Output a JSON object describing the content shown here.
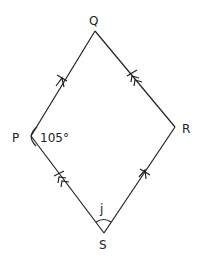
{
  "figure": {
    "type": "parallelogram",
    "vertices": {
      "P": {
        "label": "P"
      },
      "Q": {
        "label": "Q"
      },
      "R": {
        "label": "R"
      },
      "S": {
        "label": "S"
      }
    },
    "angles": {
      "P": "105°",
      "S": "j"
    },
    "markings": {
      "PQ": "single arrow + tick (parallel to SR)",
      "SR": "single arrow + tick (parallel to PQ)",
      "RQ": "double arrow + tick (parallel to SP)",
      "SP": "double arrow + tick (parallel to RQ)"
    },
    "colors": {
      "line": "#222222",
      "background": "#ffffff"
    }
  }
}
